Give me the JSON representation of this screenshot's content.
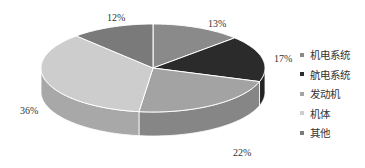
{
  "chart_data": {
    "type": "pie",
    "style": "3d",
    "title": "",
    "categories": [
      "机电系统",
      "航电系统",
      "发动机",
      "机体",
      "其他"
    ],
    "values": [
      13,
      17,
      22,
      36,
      12
    ],
    "labels": [
      "13%",
      "17%",
      "22%",
      "36%",
      "12%"
    ],
    "colors": [
      "#8a8a8a",
      "#2b2b2b",
      "#a3a3a3",
      "#cdcdcd",
      "#7a7a7a"
    ],
    "start_angle": "12 o'clock",
    "direction": "clockwise",
    "legend_position": "right"
  },
  "legend": {
    "items": [
      {
        "label": "机电系统",
        "color": "#8a8a8a"
      },
      {
        "label": "航电系统",
        "color": "#2b2b2b"
      },
      {
        "label": "发动机",
        "color": "#a3a3a3"
      },
      {
        "label": "机体",
        "color": "#cdcdcd"
      },
      {
        "label": "其他",
        "color": "#7a7a7a"
      }
    ]
  }
}
